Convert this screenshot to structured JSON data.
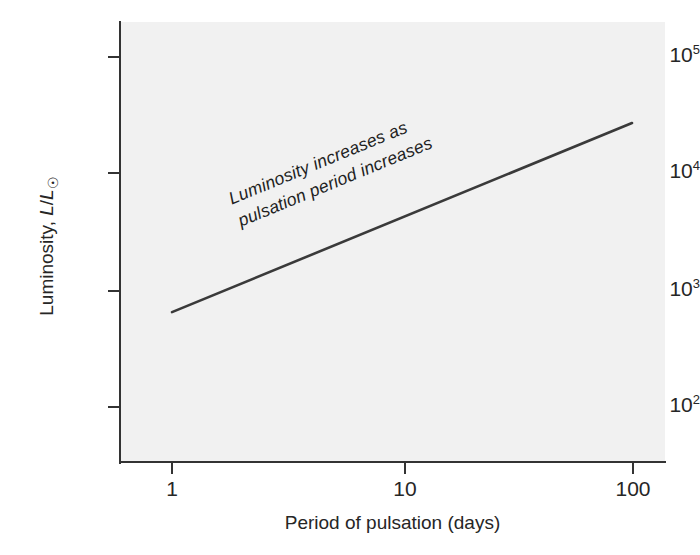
{
  "chart_data": {
    "type": "line",
    "title": "",
    "subtitle": "",
    "xlabel": "Period of pulsation (days)",
    "ylabel": "Luminosity, L/L☉",
    "xscale": "log",
    "yscale": "log",
    "xlim": [
      0.55,
      230
    ],
    "ylim": [
      55,
      230000
    ],
    "grid": false,
    "legend": null,
    "x_tick_labels": [
      "1",
      "10",
      "100"
    ],
    "x_tick_values": [
      1,
      10,
      100
    ],
    "y_tick_labels": [
      "10²",
      "10³",
      "10⁴",
      "10⁵"
    ],
    "y_tick_values": [
      100,
      1000,
      10000,
      100000
    ],
    "y_tick_mantissa": [
      "10",
      "10",
      "10",
      "10"
    ],
    "y_tick_exponent": [
      "2",
      "3",
      "4",
      "5"
    ],
    "series": [
      {
        "name": "period-luminosity relation",
        "x": [
          1,
          100
        ],
        "y": [
          650,
          26000
        ],
        "color": "#3a3a3a",
        "width_px": 2.6
      }
    ],
    "annotations": [
      {
        "name": "trend-note",
        "line1": "Luminosity increases as",
        "line2": "pulsation period increases",
        "rotation_deg": -22.4
      }
    ],
    "panel_background": "#f1f1f1",
    "figure_background": "#ffffff",
    "axis_color": "#333333",
    "text_color": "#262626"
  },
  "y_axis_title": {
    "lead": "Luminosity, ",
    "symbol_l1": "L",
    "slash": "/",
    "symbol_l2": "L",
    "sun": "☉"
  }
}
